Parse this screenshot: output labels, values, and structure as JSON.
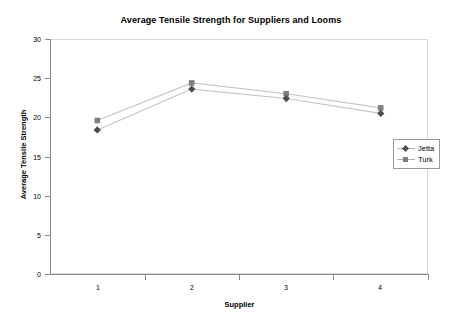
{
  "chart_data": {
    "type": "line",
    "title": "Average Tensile Strength for Suppliers and Looms",
    "xlabel": "Supplier",
    "ylabel": "Average Tensile Strength",
    "categories": [
      "1",
      "2",
      "3",
      "4"
    ],
    "series": [
      {
        "name": "Jetta",
        "marker": "diamond",
        "color": "#4d4d4d",
        "values": [
          18.4,
          23.6,
          22.4,
          20.5
        ]
      },
      {
        "name": "Turk",
        "marker": "square",
        "color": "#808080",
        "values": [
          19.6,
          24.4,
          23.0,
          21.2
        ]
      }
    ],
    "ylim": [
      0,
      30
    ],
    "yticks": [
      "0",
      "5",
      "10",
      "15",
      "20",
      "25",
      "30"
    ],
    "ytick_values": [
      0,
      5,
      10,
      15,
      20,
      25,
      30
    ],
    "grid": false,
    "legend_position": "right"
  },
  "legend": {
    "entries": [
      {
        "label": "Jetta"
      },
      {
        "label": "Turk"
      }
    ]
  },
  "colors": {
    "background": "#ffffff",
    "axis": "#8a8a8a",
    "frame": "#d9d9d9",
    "jetta": "#4d4d4d",
    "turk": "#808080",
    "line": "#bfbfbf",
    "text": "#000000"
  }
}
